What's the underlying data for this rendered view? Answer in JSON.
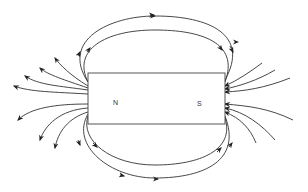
{
  "diagram": {
    "type": "bar-magnet-field-lines",
    "magnet": {
      "north_label": "N",
      "south_label": "S"
    },
    "colors": {
      "line": "#333333",
      "magnet_outline": "#444444",
      "background": "#ffffff"
    }
  }
}
